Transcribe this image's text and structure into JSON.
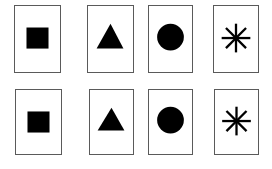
{
  "diagram": {
    "colors": {
      "border": "#5a5a5a",
      "shape": "#000000",
      "background": "#ffffff"
    },
    "rows": [
      {
        "cards": [
          {
            "shape": "square",
            "icon": "square-icon"
          },
          {
            "shape": "triangle",
            "icon": "triangle-icon"
          },
          {
            "shape": "circle",
            "icon": "circle-icon"
          },
          {
            "shape": "asterisk",
            "icon": "asterisk-icon"
          }
        ]
      },
      {
        "cards": [
          {
            "shape": "square",
            "icon": "square-icon"
          },
          {
            "shape": "triangle",
            "icon": "triangle-icon"
          },
          {
            "shape": "circle",
            "icon": "circle-icon"
          },
          {
            "shape": "asterisk",
            "icon": "asterisk-icon"
          }
        ]
      }
    ]
  }
}
